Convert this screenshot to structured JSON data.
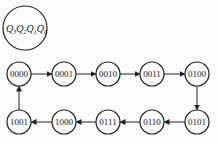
{
  "legend": {
    "label": "Q3Q2Q1Q0",
    "parts": [
      {
        "q": "Q",
        "sub": "3"
      },
      {
        "q": "Q",
        "sub": "2"
      },
      {
        "q": "Q",
        "sub": "1"
      },
      {
        "q": "Q",
        "sub": "0"
      }
    ]
  },
  "states": [
    {
      "label": "0000",
      "x": 19,
      "y": 74
    },
    {
      "label": "0001",
      "x": 64,
      "y": 74
    },
    {
      "label": "0010",
      "x": 108,
      "y": 74
    },
    {
      "label": "0011",
      "x": 152,
      "y": 74
    },
    {
      "label": "0100",
      "x": 197,
      "y": 74
    },
    {
      "label": "0101",
      "x": 197,
      "y": 122
    },
    {
      "label": "0110",
      "x": 152,
      "y": 122
    },
    {
      "label": "0111",
      "x": 108,
      "y": 122
    },
    {
      "label": "1000",
      "x": 64,
      "y": 122
    },
    {
      "label": "1001",
      "x": 19,
      "y": 122
    }
  ],
  "transitions": [
    [
      "0000",
      "0001"
    ],
    [
      "0001",
      "0010"
    ],
    [
      "0010",
      "0011"
    ],
    [
      "0011",
      "0100"
    ],
    [
      "0100",
      "0101"
    ],
    [
      "0101",
      "0110"
    ],
    [
      "0110",
      "0111"
    ],
    [
      "0111",
      "1000"
    ],
    [
      "1000",
      "1001"
    ],
    [
      "1001",
      "0000"
    ]
  ],
  "colors": {
    "stroke": "#222222",
    "background": "#fbfbfb"
  }
}
